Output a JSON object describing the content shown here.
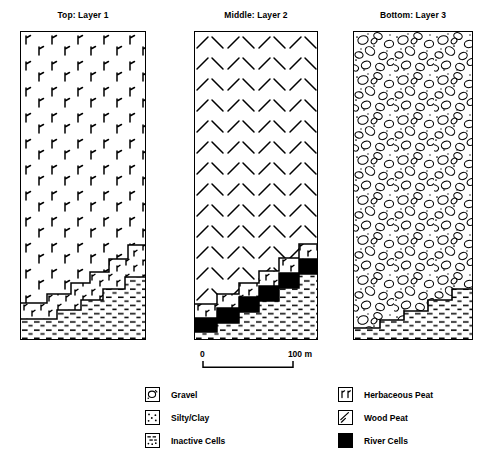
{
  "figure": {
    "kind": "stratigraphic-cross-section-panels",
    "panel_count": 3
  },
  "panels": [
    {
      "id": "panel-1",
      "title": "Top: Layer 1",
      "upper_fill": "herbaceous-peat",
      "has_river_cells": false,
      "step_count": 6
    },
    {
      "id": "panel-2",
      "title": "Middle: Layer 2",
      "upper_fill": "wood-peat",
      "has_river_cells": true,
      "step_count": 6
    },
    {
      "id": "panel-3",
      "title": "Bottom: Layer 3",
      "upper_fill": "gravel",
      "has_river_cells": false,
      "step_count": 5
    }
  ],
  "scalebar": {
    "zero_label": "0",
    "max_label": "100 m"
  },
  "legend": {
    "left_column": [
      {
        "swatch": "gravel",
        "label": "Gravel"
      },
      {
        "swatch": "silty-clay",
        "label": "Silty/Clay"
      },
      {
        "swatch": "inactive-cells",
        "label": "Inactive Cells"
      }
    ],
    "right_column": [
      {
        "swatch": "herbaceous-peat",
        "label": "Herbaceous Peat"
      },
      {
        "swatch": "wood-peat",
        "label": "Wood Peat"
      },
      {
        "swatch": "river-cells",
        "label": "River Cells"
      }
    ]
  },
  "colors": {
    "ink": "#000000",
    "paper": "#ffffff",
    "river_cells": "#000000"
  }
}
